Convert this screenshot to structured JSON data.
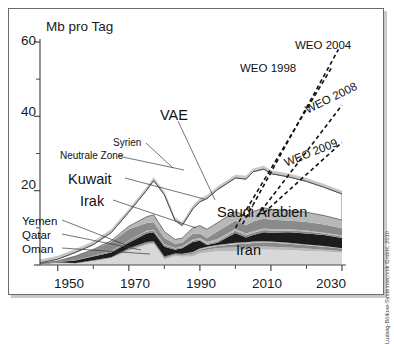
{
  "axes": {
    "y_title": "Mb pro Tag",
    "y_ticks": [
      "60",
      "40",
      "20"
    ],
    "x_ticks": [
      "1950",
      "1970",
      "1990",
      "2010",
      "2030"
    ]
  },
  "labels": {
    "syrien": "Syrien",
    "neutrale_zone": "Neutrale Zone",
    "kuwait": "Kuwait",
    "irak": "Irak",
    "yemen": "Yemen",
    "qatar": "Qatar",
    "oman": "Oman",
    "vae": "VAE",
    "saudi": "Saudi Arabien",
    "iran": "Iran",
    "weo1998": "WEO 1998",
    "weo2004": "WEO 2004",
    "weo2008": "WEO 2008",
    "weo2009": "WEO 2009"
  },
  "credit": "Ludwig-Bölkow-Systemtechnik GmbH, 2010",
  "colors": {
    "frame": "#6d6d6d",
    "shadow": "#c9c9c9",
    "iran": "#d8d8d8",
    "band_dark": "#1c1c1c",
    "band_mid": "#8a8a8a",
    "band_light": "#b8b8b8",
    "saudi": "#ffffff",
    "vae_halo": "#bdbdbd",
    "text": "#111111"
  },
  "chart_data": {
    "type": "area",
    "title": "",
    "subtitle": "",
    "xlabel": "",
    "ylabel": "Mb pro Tag",
    "xlim": [
      1945,
      2030
    ],
    "ylim": [
      0,
      60
    ],
    "grid": false,
    "legend": "inline-annotations",
    "stacked": true,
    "x": [
      1945,
      1950,
      1955,
      1960,
      1965,
      1970,
      1975,
      1977,
      1980,
      1983,
      1985,
      1988,
      1990,
      1992,
      1995,
      2000,
      2003,
      2005,
      2008,
      2010,
      2015,
      2020,
      2025,
      2030
    ],
    "series": [
      {
        "name": "Iran",
        "values": [
          0.2,
          0.7,
          0.4,
          1.1,
          1.9,
          3.8,
          5.4,
          5.7,
          1.5,
          2.4,
          2.2,
          2.3,
          3.1,
          3.4,
          3.7,
          3.8,
          4.0,
          4.1,
          4.2,
          4.1,
          4.0,
          3.8,
          3.6,
          3.3
        ]
      },
      {
        "name": "Oman",
        "values": [
          0.0,
          0.0,
          0.0,
          0.0,
          0.0,
          0.3,
          0.3,
          0.3,
          0.3,
          0.4,
          0.5,
          0.6,
          0.7,
          0.7,
          0.9,
          1.0,
          0.8,
          0.8,
          0.8,
          0.8,
          0.7,
          0.6,
          0.5,
          0.4
        ]
      },
      {
        "name": "Qatar",
        "values": [
          0.0,
          0.0,
          0.1,
          0.2,
          0.2,
          0.4,
          0.5,
          0.4,
          0.5,
          0.3,
          0.3,
          0.4,
          0.4,
          0.5,
          0.5,
          0.8,
          0.9,
          1.0,
          1.1,
          1.1,
          1.0,
          0.9,
          0.8,
          0.7
        ]
      },
      {
        "name": "Yemen",
        "values": [
          0.0,
          0.0,
          0.0,
          0.0,
          0.0,
          0.0,
          0.0,
          0.0,
          0.0,
          0.0,
          0.0,
          0.2,
          0.2,
          0.3,
          0.3,
          0.4,
          0.4,
          0.4,
          0.3,
          0.3,
          0.3,
          0.2,
          0.2,
          0.1
        ]
      },
      {
        "name": "Irak",
        "values": [
          0.1,
          0.1,
          0.7,
          1.0,
          1.3,
          1.5,
          2.3,
          2.4,
          2.6,
          1.0,
          1.5,
          2.7,
          2.1,
          0.5,
          0.6,
          2.6,
          1.3,
          1.8,
          2.4,
          2.4,
          2.8,
          3.0,
          3.0,
          2.8
        ]
      },
      {
        "name": "Neutrale Zone",
        "values": [
          0.0,
          0.0,
          0.1,
          0.2,
          0.3,
          0.5,
          0.5,
          0.5,
          0.5,
          0.3,
          0.3,
          0.4,
          0.4,
          0.3,
          0.4,
          0.6,
          0.6,
          0.6,
          0.6,
          0.6,
          0.5,
          0.5,
          0.4,
          0.4
        ]
      },
      {
        "name": "Syrien",
        "values": [
          0.0,
          0.0,
          0.0,
          0.0,
          0.1,
          0.1,
          0.2,
          0.2,
          0.2,
          0.2,
          0.2,
          0.3,
          0.4,
          0.5,
          0.6,
          0.5,
          0.5,
          0.4,
          0.4,
          0.4,
          0.3,
          0.3,
          0.2,
          0.2
        ]
      },
      {
        "name": "Kuwait",
        "values": [
          0.1,
          0.3,
          1.1,
          1.7,
          2.4,
          3.0,
          2.1,
          2.0,
          1.7,
          1.1,
          1.0,
          1.5,
          1.2,
          1.1,
          2.1,
          2.2,
          2.2,
          2.6,
          2.7,
          2.5,
          2.4,
          2.3,
          2.2,
          2.0
        ]
      },
      {
        "name": "VAE",
        "values": [
          0.0,
          0.0,
          0.0,
          0.0,
          0.3,
          0.8,
          1.7,
          2.0,
          1.7,
          1.2,
          1.2,
          1.6,
          2.1,
          2.3,
          2.3,
          2.5,
          2.5,
          2.7,
          2.9,
          2.8,
          2.7,
          2.6,
          2.4,
          2.2
        ]
      },
      {
        "name": "Saudi Arabien",
        "values": [
          0.2,
          0.5,
          1.0,
          1.3,
          2.2,
          3.8,
          7.1,
          9.2,
          9.9,
          5.1,
          3.4,
          5.1,
          6.4,
          8.3,
          8.9,
          9.0,
          9.9,
          10.7,
          10.4,
          9.6,
          9.0,
          8.3,
          7.6,
          7.0
        ]
      }
    ],
    "forecasts": [
      {
        "name": "WEO 1998",
        "x": [
          2000,
          2027
        ],
        "y": [
          10.0,
          53.0
        ],
        "style": "dashed"
      },
      {
        "name": "WEO 2004",
        "x": [
          2002,
          2029
        ],
        "y": [
          11.0,
          58.0
        ],
        "style": "dashed"
      },
      {
        "name": "WEO 2008",
        "x": [
          2006,
          2030
        ],
        "y": [
          13.0,
          43.0
        ],
        "style": "dashed"
      },
      {
        "name": "WEO 2009",
        "x": [
          2008,
          2030
        ],
        "y": [
          14.0,
          33.0
        ],
        "style": "dashed"
      }
    ]
  }
}
